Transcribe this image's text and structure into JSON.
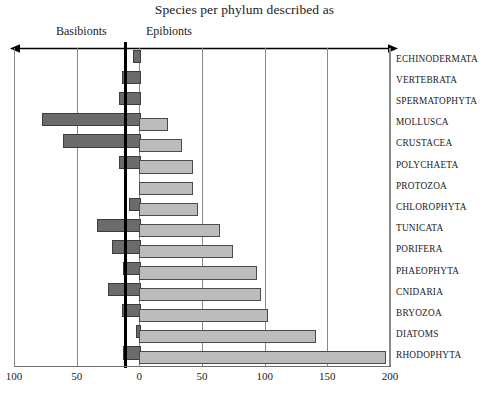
{
  "title": "Species per phylum described as",
  "sides": {
    "left_label": "Basibionts",
    "right_label": "Epibionts"
  },
  "axis": {
    "ticks": [
      {
        "label": "100",
        "value": -100
      },
      {
        "label": "50",
        "value": -50
      },
      {
        "label": "0",
        "value": 0
      },
      {
        "label": "50",
        "value": 50
      },
      {
        "label": "100",
        "value": 100
      },
      {
        "label": "150",
        "value": 150
      },
      {
        "label": "200",
        "value": 200
      }
    ],
    "left_max": 100,
    "right_max": 200
  },
  "colors": {
    "basibionts_fill": "#6b6b6b",
    "basibionts_stroke": "#3c3c3c",
    "epibionts_fill": "#bcbcbc",
    "epibionts_stroke": "#4a4a4a",
    "grid": "#8a8a8a",
    "zero_axis": "#000000"
  },
  "chart_data": {
    "type": "bar",
    "orientation": "horizontal",
    "layout": "diverging-bidirectional",
    "title": "Species per phylum described as",
    "xlabel": "",
    "ylabel": "",
    "grid": true,
    "legend_position": "top-inline",
    "xlim": [
      -100,
      200
    ],
    "xticks": [
      -100,
      -50,
      0,
      50,
      100,
      150,
      200
    ],
    "xticklabels": [
      "100",
      "50",
      "0",
      "50",
      "100",
      "150",
      "200"
    ],
    "categories": [
      "ECHINODERMATA",
      "VERTEBRATA",
      "SPERMATOPHYTA",
      "MOLLUSCA",
      "CRUSTACEA",
      "POLYCHAETA",
      "PROTOZOA",
      "CHLOROPHYTA",
      "TUNICATA",
      "PORIFERA",
      "PHAEOPHYTA",
      "CNIDARIA",
      "BRYOZOA",
      "DIATOMS",
      "RHODOPHYTA"
    ],
    "series": [
      {
        "name": "Basibionts",
        "direction": "left",
        "values": [
          5,
          14,
          16,
          78,
          61,
          16,
          0,
          8,
          34,
          22,
          13,
          25,
          14,
          3,
          13
        ]
      },
      {
        "name": "Epibionts",
        "direction": "right",
        "values": [
          0,
          0,
          0,
          23,
          34,
          43,
          43,
          47,
          64,
          75,
          94,
          97,
          103,
          141,
          197
        ]
      }
    ]
  }
}
